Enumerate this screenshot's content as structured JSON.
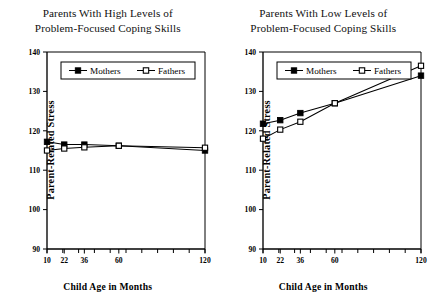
{
  "figure": {
    "ylabel": "Parent-Related Stress",
    "xlabel": "Child Age in Months"
  },
  "chart_data": [
    {
      "type": "line",
      "panel": "left",
      "title": "Parents With High Levels of\nProblem-Focused Coping Skills",
      "title_line1": "Parents With High Levels of",
      "title_line2": "Problem-Focused Coping Skills",
      "xlabel": "Child Age in Months",
      "ylabel": "Parent-Related Stress",
      "categories": [
        10,
        22,
        36,
        60,
        120
      ],
      "xtick_labels": [
        "10",
        "22",
        "36",
        "60",
        "120"
      ],
      "ytick_labels": [
        "90",
        "100",
        "110",
        "120",
        "130",
        "140"
      ],
      "yticks": [
        90,
        100,
        110,
        120,
        130,
        140
      ],
      "ylim": [
        90,
        140
      ],
      "xlim": [
        10,
        120
      ],
      "grid": false,
      "legend_position": "top-center",
      "series": [
        {
          "name": "Mothers",
          "marker": "filled-square",
          "values": [
            117.2,
            116.5,
            116.5,
            116.2,
            115.0
          ]
        },
        {
          "name": "Fathers",
          "marker": "open-square",
          "values": [
            115.0,
            115.5,
            115.8,
            116.2,
            115.7
          ]
        }
      ]
    },
    {
      "type": "line",
      "panel": "right",
      "title": "Parents With Low Levels of\nProblem-Focused Coping Skills",
      "title_line1": "Parents With Low Levels of",
      "title_line2": "Problem-Focused Coping Skills",
      "xlabel": "Child Age in Months",
      "ylabel": "Parent-Related Stress",
      "categories": [
        10,
        22,
        36,
        60,
        120
      ],
      "xtick_labels": [
        "10",
        "22",
        "36",
        "60",
        "120"
      ],
      "ytick_labels": [
        "90",
        "100",
        "110",
        "120",
        "130",
        "140"
      ],
      "yticks": [
        90,
        100,
        110,
        120,
        130,
        140
      ],
      "ylim": [
        90,
        140
      ],
      "xlim": [
        10,
        120
      ],
      "grid": false,
      "legend_position": "top-center",
      "series": [
        {
          "name": "Mothers",
          "marker": "filled-square",
          "values": [
            121.8,
            122.7,
            124.5,
            127.0,
            134.0
          ]
        },
        {
          "name": "Fathers",
          "marker": "open-square",
          "values": [
            118.0,
            120.3,
            122.3,
            127.0,
            136.5
          ]
        }
      ]
    }
  ],
  "colors": {
    "axis": "#000000",
    "line": "#000000",
    "marker_filled": "#000000",
    "marker_open_fill": "#ffffff",
    "background": "#ffffff"
  }
}
